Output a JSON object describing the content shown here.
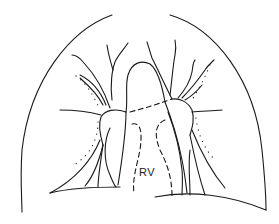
{
  "diagram": {
    "type": "chest-radiograph-schematic",
    "labels": {
      "rv": "RV"
    },
    "colors": {
      "line": "#1a1a1a",
      "background": "#ffffff"
    }
  }
}
